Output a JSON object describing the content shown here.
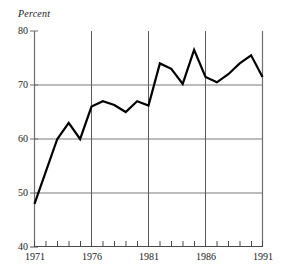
{
  "chart_data": {
    "type": "line",
    "title": "",
    "subtitle": "",
    "ylabel": "Percent",
    "xlabel": "",
    "ylim": [
      40,
      80
    ],
    "xlim": [
      1971,
      1991
    ],
    "y_ticks": [
      80,
      70,
      60,
      50,
      40
    ],
    "x_ticks": [
      1971,
      1976,
      1981,
      1986,
      1991
    ],
    "x_minor_ticks": [
      1972,
      1973,
      1974,
      1975,
      1977,
      1978,
      1979,
      1980,
      1982,
      1983,
      1984,
      1985,
      1987,
      1988,
      1989,
      1990
    ],
    "grid": "horizontal-and-vertical-at-major-ticks",
    "legend": "none",
    "line_color": "#000000",
    "grid_color": "#808080",
    "axis_color": "#808080",
    "x": [
      1971,
      1972,
      1973,
      1974,
      1975,
      1976,
      1977,
      1978,
      1979,
      1980,
      1981,
      1982,
      1983,
      1984,
      1985,
      1986,
      1987,
      1988,
      1989,
      1990,
      1991
    ],
    "values": [
      48.0,
      54.0,
      60.0,
      63.0,
      60.0,
      66.0,
      67.0,
      66.3,
      65.0,
      67.0,
      66.2,
      74.0,
      73.0,
      70.2,
      76.5,
      71.5,
      70.5,
      72.0,
      74.0,
      75.5,
      71.5
    ],
    "series": [
      {
        "name": "Percent",
        "values": [
          48.0,
          54.0,
          60.0,
          63.0,
          60.0,
          66.0,
          67.0,
          66.3,
          65.0,
          67.0,
          66.2,
          74.0,
          73.0,
          70.2,
          76.5,
          71.5,
          70.5,
          72.0,
          74.0,
          75.5,
          71.5
        ]
      }
    ]
  },
  "axis": {
    "y_title": "Percent",
    "y_labels": [
      "80",
      "70",
      "60",
      "50",
      "40"
    ],
    "x_labels": [
      "1971",
      "1976",
      "1981",
      "1986",
      "1991"
    ]
  }
}
